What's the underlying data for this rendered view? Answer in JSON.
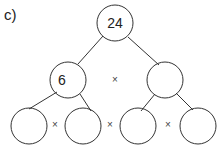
{
  "question_label": "c)",
  "colors": {
    "stroke": "#333333",
    "text": "#222222",
    "background": "#ffffff"
  },
  "tree": {
    "root": {
      "value": "24"
    },
    "level2": [
      {
        "value": "6"
      },
      {
        "value": ""
      }
    ],
    "level3": [
      {
        "value": ""
      },
      {
        "value": ""
      },
      {
        "value": ""
      },
      {
        "value": ""
      }
    ]
  },
  "operators": {
    "level2_between": "×",
    "level3_between": [
      "×",
      "×",
      "×"
    ]
  }
}
